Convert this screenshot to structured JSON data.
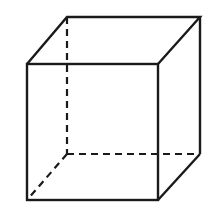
{
  "diagram": {
    "type": "wireframe-cube",
    "stroke_color": "#1a1a1a",
    "background": "#ffffff",
    "front_face": {
      "x1": 27,
      "y1": 64,
      "x2": 158,
      "y2": 200
    },
    "back_face": {
      "x1": 67,
      "y1": 17,
      "x2": 200,
      "y2": 154
    },
    "hidden_edges": "dashed"
  }
}
